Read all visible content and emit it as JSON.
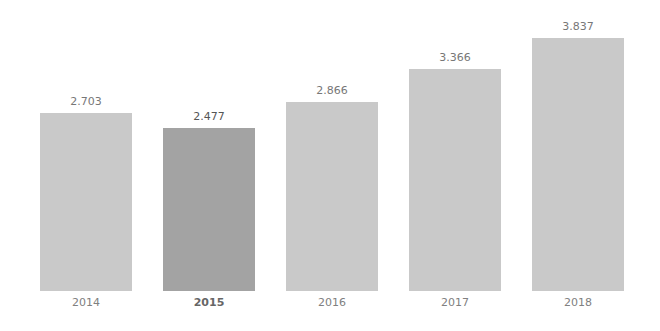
{
  "chart_data": {
    "type": "bar",
    "title": "",
    "xlabel": "",
    "ylabel": "",
    "categories": [
      "2014",
      "2015",
      "2016",
      "2017",
      "2018"
    ],
    "values": [
      2.703,
      2.477,
      2.866,
      3.366,
      3.837
    ],
    "value_labels": [
      "2.703",
      "2.477",
      "2.866",
      "3.366",
      "3.837"
    ],
    "highlighted_category": "2015",
    "ylim": [
      0,
      4
    ],
    "grid": false,
    "legend": null
  },
  "colors": {
    "bar_default": "#c9c9c9",
    "bar_highlight": "#a3a3a3",
    "label_text": "#777777"
  }
}
